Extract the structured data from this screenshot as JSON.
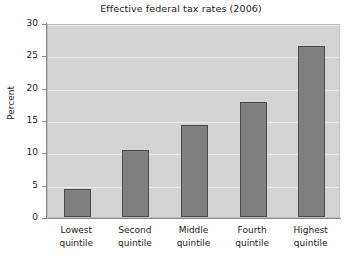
{
  "chart_data": {
    "type": "bar",
    "title": "Effective federal tax rates (2006)",
    "xlabel": "",
    "ylabel": "Percent",
    "categories": [
      "Lowest quintile",
      "Second quintile",
      "Middle quintile",
      "Fourth quintile",
      "Highest quintile"
    ],
    "category_lines": [
      [
        "Lowest",
        "quintile"
      ],
      [
        "Second",
        "quintile"
      ],
      [
        "Middle",
        "quintile"
      ],
      [
        "Fourth",
        "quintile"
      ],
      [
        "Highest",
        "quintile"
      ]
    ],
    "values": [
      4.3,
      10.4,
      14.3,
      17.8,
      26.4
    ],
    "ylim": [
      0,
      30
    ],
    "yticks": [
      0,
      5,
      10,
      15,
      20,
      25,
      30
    ],
    "ytick_labels": [
      "0",
      "5",
      "10",
      "15",
      "20",
      "25",
      "30"
    ],
    "grid": true,
    "legend": "none",
    "colors": {
      "bar_fill": "#808080",
      "bar_edge": "#4a4a4a",
      "panel_background": "#d4d4d4",
      "gridline": "#eceded",
      "axis": "#8a8a8a",
      "text": "#222222",
      "figure_background": "#ffffff"
    }
  }
}
